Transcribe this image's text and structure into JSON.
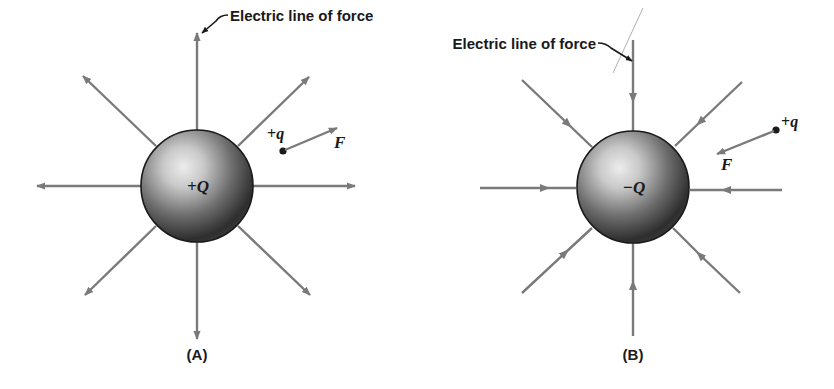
{
  "figure": {
    "colors": {
      "field_line": "#7a7a7a",
      "sphere_dark": "#2a2a2a",
      "sphere_light": "#e6e6e6",
      "text": "#1a1a1a",
      "background": "#ffffff"
    },
    "panels": [
      {
        "id": "A",
        "caption": "(A)",
        "source_charge_label": "+Q",
        "source_charge_sign": "positive",
        "field_direction": "outward",
        "callout_label": "Electric line of force",
        "test_charge": {
          "sign_label": "+",
          "symbol": "q"
        },
        "force_label": "F",
        "force_direction": "away from source"
      },
      {
        "id": "B",
        "caption": "(B)",
        "source_charge_label": "−Q",
        "source_charge_sign": "negative",
        "field_direction": "inward",
        "callout_label": "Electric line of force",
        "test_charge": {
          "sign_label": "+",
          "symbol": "q"
        },
        "force_label": "F",
        "force_direction": "toward source"
      }
    ]
  }
}
